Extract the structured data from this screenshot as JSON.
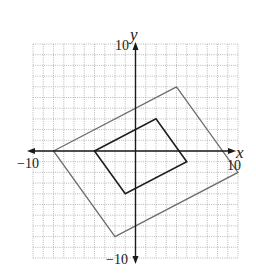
{
  "chart_data": {
    "type": "diagram",
    "title": "",
    "xlabel": "x",
    "ylabel": "y",
    "xlim": [
      -10,
      10
    ],
    "ylim": [
      -10,
      10
    ],
    "grid": true,
    "grid_step": 1,
    "tick_labels": {
      "x_min": "−10",
      "x_max": "10",
      "y_min": "−10",
      "y_max": "10"
    },
    "shapes": [
      {
        "name": "outer quadrilateral",
        "color": "#6e6e6e",
        "vertices": [
          [
            -8,
            0
          ],
          [
            4,
            6
          ],
          [
            10,
            -2
          ],
          [
            -2,
            -8
          ]
        ]
      },
      {
        "name": "inner quadrilateral",
        "color": "#1e1e1e",
        "vertices": [
          [
            -4,
            0
          ],
          [
            2,
            3
          ],
          [
            5,
            -1
          ],
          [
            -1,
            -4
          ]
        ]
      }
    ]
  },
  "labels": {
    "x_axis": "x",
    "y_axis": "y",
    "x_min": "−10",
    "x_max": "10",
    "y_min": "−10",
    "y_max": "10"
  }
}
